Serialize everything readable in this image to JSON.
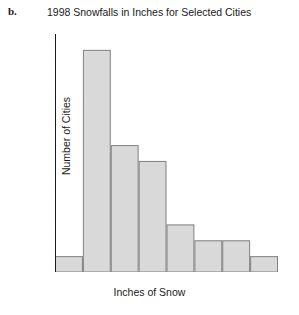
{
  "part_label": "b.",
  "labels": {
    "title": "1998 Snowfalls in Inches for Selected Cities",
    "xlabel": "Inches of Snow",
    "ylabel": "Number of Cities"
  },
  "colors": {
    "bar_fill": "#d9d9d9",
    "bar_stroke": "#808080",
    "axis": "#1a1a1a",
    "background": "#ffffff",
    "text": "#1a1a1a"
  },
  "chart_data": {
    "type": "bar",
    "title": "1998 Snowfalls in Inches for Selected Cities",
    "xlabel": "Inches of Snow",
    "ylabel": "Number of Cities",
    "histogram": true,
    "bin_width": 15,
    "bin_edges": [
      0,
      15,
      30,
      45,
      60,
      75,
      90,
      105,
      120
    ],
    "categories": [
      "0-15",
      "15-30",
      "30-45",
      "45-60",
      "60-75",
      "75-90",
      "90-105",
      "105-120"
    ],
    "values": [
      1,
      14,
      8,
      7,
      3,
      2,
      2,
      1
    ],
    "xlim": [
      0,
      120
    ],
    "ylim": [
      0,
      15
    ],
    "xticks": [
      0,
      15,
      30,
      45,
      60,
      75,
      90,
      105,
      120
    ],
    "yticks": [
      0,
      1,
      2,
      3,
      4,
      5,
      6,
      7,
      8,
      9,
      10,
      11,
      12,
      13,
      14,
      15
    ],
    "xtick_labels": [
      "0",
      "15",
      "30",
      "45",
      "60",
      "75",
      "90",
      "105",
      "120"
    ],
    "ytick_labels": [
      "0",
      "1",
      "2",
      "3",
      "4",
      "5",
      "6",
      "7",
      "8",
      "9",
      "10",
      "11",
      "12",
      "13",
      "14",
      "15"
    ],
    "grid": false,
    "legend": null
  }
}
